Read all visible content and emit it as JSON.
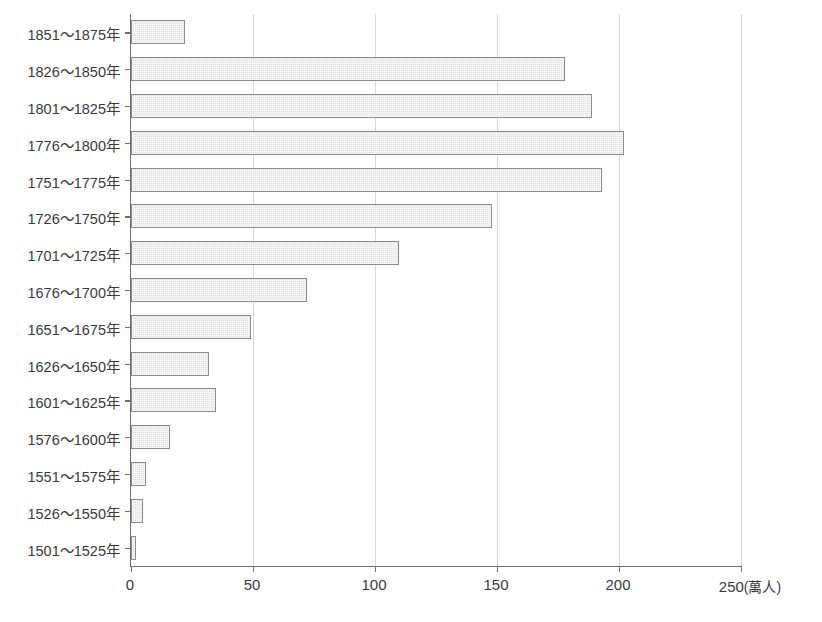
{
  "chart_data": {
    "type": "bar",
    "orientation": "horizontal",
    "title": "",
    "subtitle": "",
    "xlabel": "(萬人)",
    "ylabel": "",
    "unit": "萬人",
    "xlim": [
      0,
      250
    ],
    "xticks": [
      0,
      50,
      100,
      150,
      200,
      250
    ],
    "xtick_labels": [
      "0",
      "50",
      "100",
      "150",
      "200",
      "250"
    ],
    "grid": true,
    "grid_axis": "x",
    "legend": null,
    "categories": [
      "1851～1875年",
      "1826～1850年",
      "1801～1825年",
      "1776～1800年",
      "1751～1775年",
      "1726～1750年",
      "1701～1725年",
      "1676～1700年",
      "1651～1675年",
      "1626～1650年",
      "1601～1625年",
      "1576～1600年",
      "1551～1575年",
      "1526～1550年",
      "1501～1525年"
    ],
    "values": [
      22,
      178,
      189,
      202,
      193,
      148,
      110,
      72,
      49,
      32,
      35,
      16,
      6,
      5,
      2
    ],
    "bar_fill_color": "#e2e2e2",
    "bar_edge_color": "#8c8c8c",
    "axis_color": "#6f6f6f",
    "grid_color": "#d8d8d8",
    "background_color": "#ffffff"
  },
  "axis": {
    "unit_label": "(萬人)"
  }
}
